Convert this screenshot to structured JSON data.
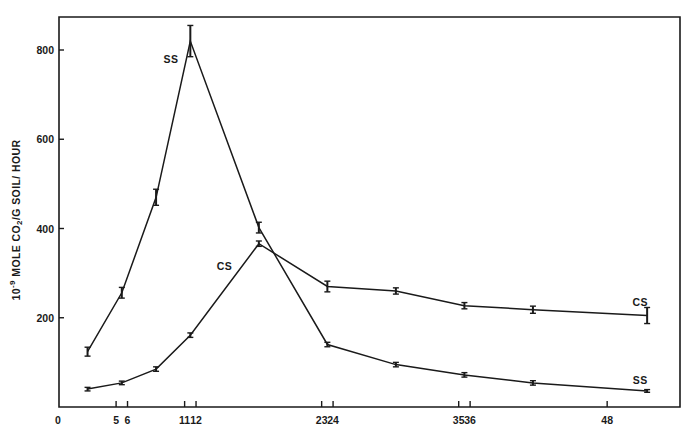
{
  "chart_data": {
    "type": "line",
    "title": "",
    "xlabel": "",
    "ylabel": "10^-9 MOLE CO2/G SOIL/HOUR",
    "ylabel_parts": {
      "prefix": "10",
      "sup": "-9",
      "mid": " MOLE CO",
      "sub": "2",
      "suffix": "/G  SOIL/ HOUR"
    },
    "xlim": [
      0,
      54.4
    ],
    "ylim": [
      0,
      870
    ],
    "grid": false,
    "legend": "inline labels at line ends",
    "x_ticks": [
      5,
      6,
      11,
      12,
      23,
      24,
      35,
      36,
      48
    ],
    "x_tick_labels": [
      "0",
      "5",
      "6",
      "11",
      "12",
      "23",
      "24",
      "35",
      "36",
      "48"
    ],
    "x_tick_label_positions": [
      0,
      5,
      6,
      11,
      12,
      23,
      24,
      35,
      36,
      48
    ],
    "y_ticks": [
      200,
      400,
      600,
      800
    ],
    "y_tick_labels": [
      "200",
      "400",
      "600",
      "800"
    ],
    "series": [
      {
        "name": "SS",
        "x": [
          2.5,
          5.5,
          8.5,
          11.5,
          17.5,
          23.5,
          29.5,
          35.5,
          41.5,
          51.5
        ],
        "values": [
          124,
          256,
          470,
          820,
          402,
          140,
          95,
          72,
          54,
          36
        ],
        "error": [
          10,
          12,
          18,
          35,
          12,
          5,
          5,
          5,
          5,
          3
        ]
      },
      {
        "name": "CS",
        "x": [
          2.5,
          5.5,
          8.5,
          11.5,
          17.5,
          23.5,
          29.5,
          35.5,
          41.5,
          51.5
        ],
        "values": [
          40,
          54,
          85,
          161,
          366,
          270,
          260,
          227,
          218,
          205
        ],
        "error": [
          4,
          4,
          5,
          5,
          6,
          12,
          7,
          7,
          8,
          18
        ]
      }
    ],
    "annotations": [
      {
        "text": "SS",
        "x": 9.8,
        "y": 780
      },
      {
        "text": "CS",
        "x": 14.5,
        "y": 315
      },
      {
        "text": "CS",
        "x": 50.9,
        "y": 235
      },
      {
        "text": "SS",
        "x": 50.9,
        "y": 60
      }
    ]
  }
}
